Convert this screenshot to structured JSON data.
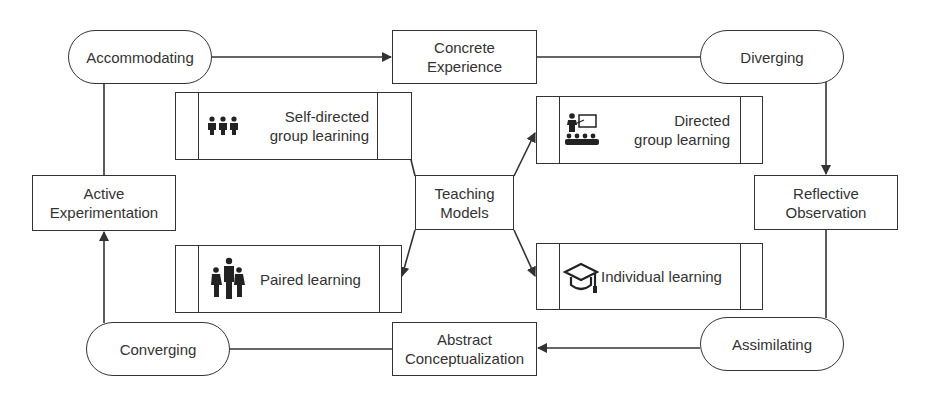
{
  "diagram": {
    "cycle_stages": [
      {
        "id": "concrete",
        "label": "Concrete Experience",
        "line1": "Concrete",
        "line2": "Experience"
      },
      {
        "id": "reflective",
        "label": "Reflective Observation",
        "line1": "Reflective",
        "line2": "Observation"
      },
      {
        "id": "abstract",
        "label": "Abstract Conceptualization",
        "line1": "Abstract",
        "line2": "Conceptualization"
      },
      {
        "id": "active",
        "label": "Active Experimentation",
        "line1": "Active",
        "line2": "Experimentation"
      }
    ],
    "learning_styles": [
      {
        "id": "accommodating",
        "label": "Accommodating"
      },
      {
        "id": "diverging",
        "label": "Diverging"
      },
      {
        "id": "assimilating",
        "label": "Assimilating"
      },
      {
        "id": "converging",
        "label": "Converging"
      }
    ],
    "center": {
      "line1": "Teaching",
      "line2": "Models"
    },
    "teaching_models": [
      {
        "id": "self-directed",
        "line1": "Self-directed",
        "line2": "group learining",
        "icon": "group-of-three-people-icon"
      },
      {
        "id": "directed",
        "line1": "Directed",
        "line2": "group learning",
        "icon": "teacher-presentation-icon"
      },
      {
        "id": "paired",
        "line1": "Paired learning",
        "line2": "",
        "icon": "family-people-icon"
      },
      {
        "id": "individual",
        "line1": "Individual learning",
        "line2": "",
        "icon": "graduation-cap-icon"
      }
    ],
    "edges": [
      {
        "from": "Accommodating",
        "to": "Concrete Experience"
      },
      {
        "from": "Concrete Experience",
        "to": "Diverging"
      },
      {
        "from": "Diverging",
        "to": "Reflective Observation"
      },
      {
        "from": "Reflective Observation",
        "to": "Assimilating"
      },
      {
        "from": "Assimilating",
        "to": "Abstract Conceptualization"
      },
      {
        "from": "Abstract Conceptualization",
        "to": "Converging"
      },
      {
        "from": "Converging",
        "to": "Active Experimentation"
      },
      {
        "from": "Active Experimentation",
        "to": "Accommodating"
      },
      {
        "from": "Teaching Models",
        "to": "Self-directed group learining"
      },
      {
        "from": "Teaching Models",
        "to": "Directed group learning"
      },
      {
        "from": "Teaching Models",
        "to": "Paired learning"
      },
      {
        "from": "Teaching Models",
        "to": "Individual learning"
      }
    ],
    "colors": {
      "stroke": "#333333",
      "background": "#ffffff",
      "text": "#333333"
    }
  }
}
